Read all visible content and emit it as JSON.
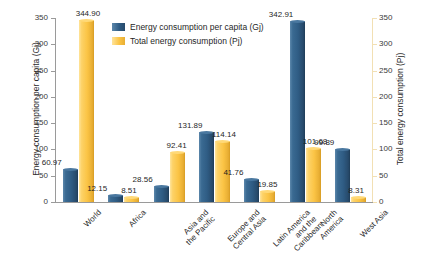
{
  "chart_data": {
    "type": "bar",
    "title": "",
    "xlabel": "",
    "categories": [
      "World",
      "Africa",
      "Asia and\nthe Pacific",
      "Europe and\nCentral Asia",
      "Latin America\nand the\nCaribbean",
      "North\nAmerica",
      "West Asia"
    ],
    "series": [
      {
        "name": "Energy consumption per capita (Gj)",
        "axis": "left",
        "color": "#2f5c84",
        "values": [
          60.97,
          12.15,
          28.56,
          131.89,
          41.76,
          342.91,
          99.89
        ],
        "labels": [
          "60.97",
          "12.15",
          "28.56",
          "131.89",
          "41.76",
          "342.91",
          "99.89"
        ]
      },
      {
        "name": "Total energy consumption (Pj)",
        "axis": "right",
        "color": "#fbc445",
        "values": [
          344.9,
          8.51,
          92.41,
          114.14,
          19.85,
          101.68,
          8.31
        ],
        "labels": [
          "344.90",
          "8.51",
          "92.41",
          "114.14",
          "19.85",
          "101.68",
          "8.31"
        ]
      }
    ],
    "left_axis": {
      "label": "Energy consumption per capita (Gj)",
      "ticks": [
        "0",
        "50",
        "100",
        "150",
        "200",
        "250",
        "300",
        "350"
      ],
      "min": 0,
      "max": 350,
      "step": 50
    },
    "right_axis": {
      "label": "Total energy consumption (Pj)",
      "ticks": [
        "0",
        "50",
        "100",
        "150",
        "200",
        "250",
        "300",
        "350"
      ],
      "min": 0,
      "max": 350,
      "step": 50
    },
    "legend": {
      "position": "top-center",
      "entries": [
        "Energy consumption per capita (Gj)",
        "Total energy consumption (Pj)"
      ]
    },
    "grid": false
  }
}
